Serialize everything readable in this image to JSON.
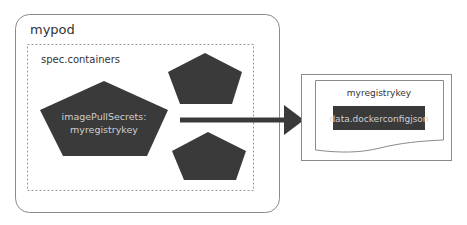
{
  "diagram": {
    "pod": {
      "title": "mypod"
    },
    "containers": {
      "title": "spec.containers"
    },
    "main_container": {
      "line1": "imagePullSecrets:",
      "line2": "myregistrykey"
    },
    "secret": {
      "title": "myregistrykey",
      "data_field": "data.dockerconfigjson"
    },
    "colors": {
      "shape_fill": "#3a3a3a",
      "border": "#7a7a7a",
      "text_dark": "#333333",
      "text_light": "#cfcfcf"
    }
  }
}
